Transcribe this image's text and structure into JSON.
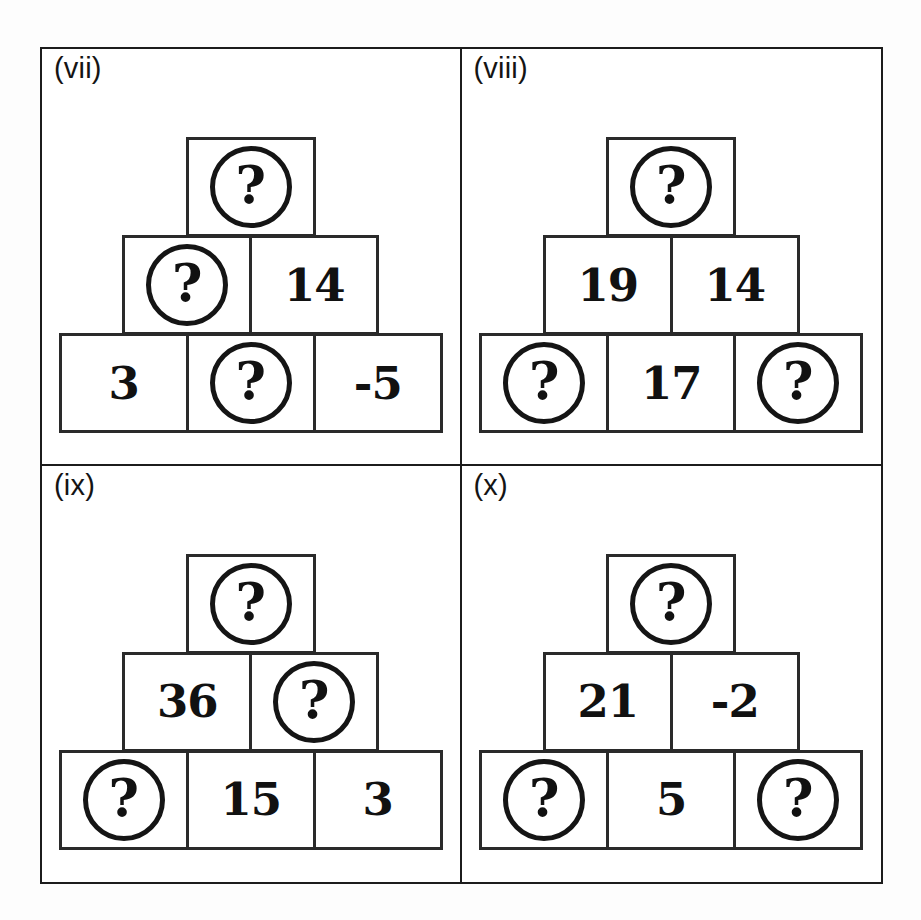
{
  "document": {
    "kind": "number-pyramid-worksheet",
    "unknown_marker": "?",
    "panel_count": 4
  },
  "colors": {
    "ink": "#111111",
    "frame": "#1c1c1c",
    "cell_border": "#2a2a2a",
    "paper": "#ffffff"
  },
  "panels": [
    {
      "label": "(vii)",
      "rows": [
        {
          "cells": [
            {
              "value": "?",
              "unknown": true
            }
          ]
        },
        {
          "cells": [
            {
              "value": "?",
              "unknown": true
            },
            {
              "value": "14",
              "unknown": false
            }
          ]
        },
        {
          "cells": [
            {
              "value": "3",
              "unknown": false
            },
            {
              "value": "?",
              "unknown": true
            },
            {
              "value": "-5",
              "unknown": false
            }
          ]
        }
      ]
    },
    {
      "label": "(viii)",
      "rows": [
        {
          "cells": [
            {
              "value": "?",
              "unknown": true
            }
          ]
        },
        {
          "cells": [
            {
              "value": "19",
              "unknown": false
            },
            {
              "value": "14",
              "unknown": false
            }
          ]
        },
        {
          "cells": [
            {
              "value": "?",
              "unknown": true
            },
            {
              "value": "17",
              "unknown": false
            },
            {
              "value": "?",
              "unknown": true
            }
          ]
        }
      ]
    },
    {
      "label": "(ix)",
      "rows": [
        {
          "cells": [
            {
              "value": "?",
              "unknown": true
            }
          ]
        },
        {
          "cells": [
            {
              "value": "36",
              "unknown": false
            },
            {
              "value": "?",
              "unknown": true
            }
          ]
        },
        {
          "cells": [
            {
              "value": "?",
              "unknown": true
            },
            {
              "value": "15",
              "unknown": false
            },
            {
              "value": "3",
              "unknown": false
            }
          ]
        }
      ]
    },
    {
      "label": "(x)",
      "rows": [
        {
          "cells": [
            {
              "value": "?",
              "unknown": true
            }
          ]
        },
        {
          "cells": [
            {
              "value": "21",
              "unknown": false
            },
            {
              "value": "-2",
              "unknown": false
            }
          ]
        },
        {
          "cells": [
            {
              "value": "?",
              "unknown": true
            },
            {
              "value": "5",
              "unknown": false
            },
            {
              "value": "?",
              "unknown": true
            }
          ]
        }
      ]
    }
  ]
}
